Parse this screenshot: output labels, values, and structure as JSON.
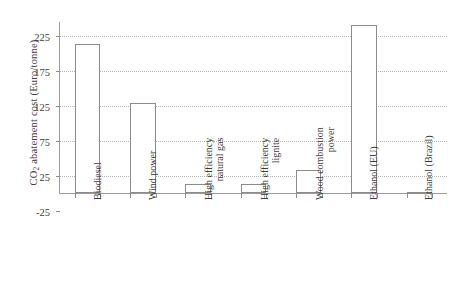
{
  "chart_data": {
    "type": "bar",
    "title": "",
    "subtitle": "",
    "xlabel": "",
    "ylabel": "CO2 abatement cost (Euro/tonne)",
    "ylabel_parts": {
      "prefix": "CO",
      "sub": "2",
      "suffix": " abatement cost (Euro/tonne)"
    },
    "categories": [
      "Biodiesel",
      "Wind power",
      "High efficiency natural gas",
      "High efficiency lignite",
      "Wood combustion power",
      "Ethanol (EU)",
      "Ethanol (Brazil)"
    ],
    "category_lines": [
      [
        "Biodiesel"
      ],
      [
        "Wind power"
      ],
      [
        "High efficiency",
        "natural gas"
      ],
      [
        "High efficiency",
        "lignite"
      ],
      [
        "Wood combustion",
        "power"
      ],
      [
        "Ethanol (EU)"
      ],
      [
        "Ethanol (Brazil)"
      ]
    ],
    "values": [
      213,
      128,
      13,
      13,
      33,
      240,
      2
    ],
    "ylim": [
      -25,
      245
    ],
    "yticks": [
      -25,
      25,
      75,
      125,
      175,
      225
    ],
    "ytick_labels": [
      "-25",
      "25",
      "75",
      "125",
      "175",
      "225"
    ],
    "grid": "horizontal-dotted",
    "legend": "none",
    "bar_fill": "#ffffff",
    "bar_edge": "#8c8c8c",
    "grid_color": "#b4b4b4",
    "axis_color": "#9b9b9b",
    "text_color": "#3c3c3c"
  }
}
